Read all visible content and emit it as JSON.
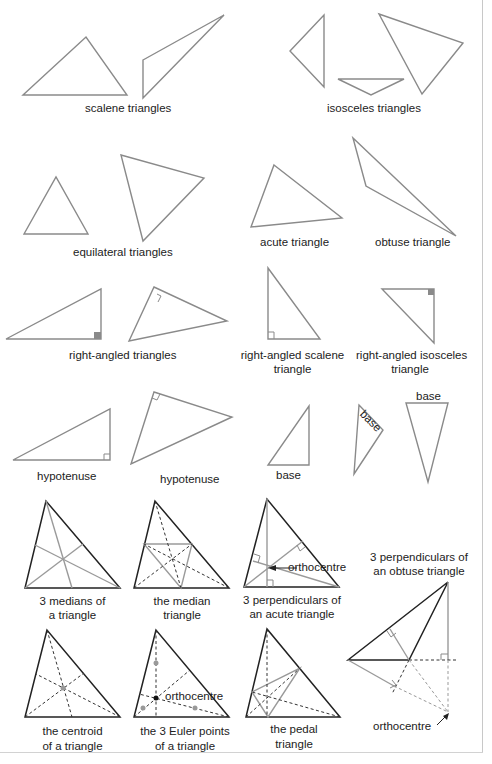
{
  "figure": {
    "labels": {
      "scalene": "scalene  triangles",
      "isosceles": "isosceles  triangles",
      "equilateral": "equilateral  triangles",
      "acute": "acute  triangle",
      "obtuse": "obtuse  triangle",
      "right_angled": "right-angled  triangles",
      "right_scalene_1": "right-angled  scalene",
      "right_scalene_2": "triangle",
      "right_isosceles_1": "right-angled  isosceles",
      "right_isosceles_2": "triangle",
      "hypotenuse_1": "hypotenuse",
      "hypotenuse_2": "hypotenuse",
      "base_1": "base",
      "base_2": "base",
      "base_3": "base",
      "medians_1": "3 medians of",
      "medians_2": "a triangle",
      "median_tri_1": "the median",
      "median_tri_2": "triangle",
      "perp_acute_1": "3 perpendiculars of",
      "perp_acute_2": "an acute triangle",
      "orthocentre_acute": "orthocentre",
      "perp_obtuse_1": "3 perpendiculars of",
      "perp_obtuse_2": "an obtuse triangle",
      "centroid_1": "the centroid",
      "centroid_2": "of a triangle",
      "euler_1": "the 3 Euler points",
      "euler_2": "of a triangle",
      "orthocentre_euler": "orthocentre",
      "pedal_1": "the pedal",
      "pedal_2": "triangle",
      "orthocentre_obtuse": "orthocentre"
    },
    "colors": {
      "outline_grey": "#8a8a8a",
      "outline_black": "#222222",
      "text": "#222222",
      "background": "#ffffff"
    }
  }
}
